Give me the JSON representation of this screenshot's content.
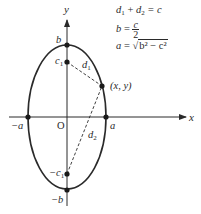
{
  "diagram": {
    "type": "ellipse-foci",
    "axes": {
      "x_label": "x",
      "y_label": "y",
      "origin_label": "O"
    },
    "points": {
      "top": "b",
      "bottom": "−b",
      "left": "−a",
      "right": "a",
      "focus_top": "c",
      "focus_top_sub": "1",
      "focus_bottom": "−c",
      "focus_bottom_sub": "1",
      "point_on_curve": "(x, y)"
    },
    "distances": {
      "d1": "d",
      "d1_sub": "1",
      "d2": "d",
      "d2_sub": "2"
    },
    "equations": {
      "eq1": {
        "lhs_a": "d",
        "lhs_a_sub": "1",
        "plus": " + ",
        "lhs_b": "d",
        "lhs_b_sub": "2",
        "rhs": " = c"
      },
      "eq2": {
        "lhs": "b",
        "equals": " = ",
        "numerator": "c",
        "denominator": "2"
      },
      "eq3": {
        "lhs": "a",
        "equals": " = √",
        "radicand": "b² − c²"
      }
    },
    "colors": {
      "stroke": "#2a2a2a",
      "background": "#ffffff"
    }
  }
}
